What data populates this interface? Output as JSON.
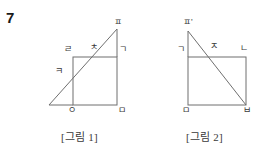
{
  "question": {
    "number": "7"
  },
  "figures": [
    {
      "id": "figure-1",
      "caption": "[그림 1]",
      "vertices": [
        {
          "name": "pieup-top",
          "label": "ㅍ",
          "x": 117,
          "y": 22
        },
        {
          "name": "rieul-top-left",
          "label": "ㄹ",
          "x": 67,
          "y": 49
        },
        {
          "name": "chieut-on-top-edge",
          "label": "ㅊ",
          "x": 93,
          "y": 48
        },
        {
          "name": "giyeok-top-right",
          "label": "ㄱ",
          "x": 121,
          "y": 50
        },
        {
          "name": "kieuk-on-left-edge",
          "label": "ㅋ",
          "x": 58,
          "y": 71
        },
        {
          "name": "ieung-bottom-left",
          "label": "ㅇ",
          "x": 71,
          "y": 108
        },
        {
          "name": "mieum-bottom-right",
          "label": "ㅁ",
          "x": 121,
          "y": 108
        }
      ],
      "shape": "square with diagonal line through it extending beyond",
      "square": {
        "left": 73,
        "top": 57,
        "right": 117,
        "bottom": 105
      },
      "diagonal": {
        "x1": 49,
        "y1": 105,
        "x2": 117,
        "y2": 29
      }
    },
    {
      "id": "figure-2",
      "caption": "[그림 2]",
      "vertices": [
        {
          "name": "pieup-prime-top-left",
          "label": "ㅍ'",
          "x": 188,
          "y": 22
        },
        {
          "name": "giyeok-top-left",
          "label": "ㄱ",
          "x": 180,
          "y": 50
        },
        {
          "name": "jieut-on-top-edge",
          "label": "ㅈ",
          "x": 213,
          "y": 46
        },
        {
          "name": "nieun-top-right",
          "label": "ㄴ",
          "x": 243,
          "y": 48
        },
        {
          "name": "mieum-bottom-left",
          "label": "ㅁ",
          "x": 185,
          "y": 108
        },
        {
          "name": "bieup-bottom-right",
          "label": "ㅂ",
          "x": 243,
          "y": 108
        }
      ],
      "shape": "rectangle with diagonal line from above top-left corner to bottom-right corner",
      "rectangle": {
        "left": 188,
        "top": 57,
        "right": 246,
        "bottom": 105
      },
      "diagonal": {
        "x1": 188,
        "y1": 31,
        "x2": 246,
        "y2": 105
      }
    }
  ],
  "style": {
    "line_color": "#6f6f6f",
    "text_color": "#3a3a3a",
    "background": "#ffffff"
  }
}
